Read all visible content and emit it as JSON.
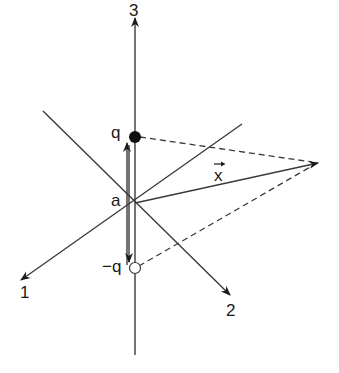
{
  "diagram": {
    "colors": {
      "line": "#3a3a3a",
      "text": "#1a1a1a",
      "background": "#ffffff"
    },
    "axes": [
      {
        "id": "axis-3",
        "label": "3"
      },
      {
        "id": "axis-1",
        "label": "1"
      },
      {
        "id": "axis-2",
        "label": "2"
      }
    ],
    "labels": {
      "origin": "a",
      "positive_charge": "q",
      "negative_charge": "−q",
      "position_vector": "x"
    }
  }
}
